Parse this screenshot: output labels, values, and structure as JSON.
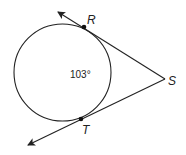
{
  "diagram": {
    "type": "circle-tangents",
    "circle": {
      "cx": 62.5,
      "cy": 72.5,
      "r": 48.5
    },
    "points": {
      "R": {
        "label": "R",
        "x": 84,
        "y": 27
      },
      "S": {
        "label": "S",
        "x": 165,
        "y": 79
      },
      "T": {
        "label": "T",
        "x": 81,
        "y": 119
      }
    },
    "arc_measure": "103°",
    "colors": {
      "stroke": "#222222",
      "background": "#ffffff"
    }
  }
}
